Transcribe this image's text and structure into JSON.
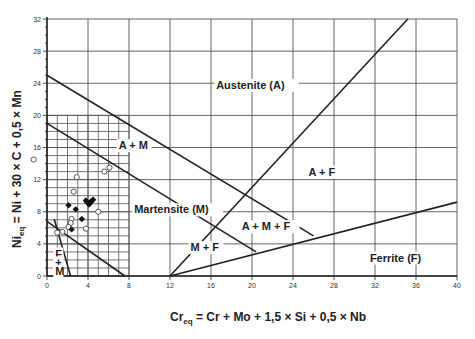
{
  "chart_data": {
    "type": "scatter",
    "title": "",
    "xlabel": "Cr_eq = Cr + Mo + 1,5 × Si + 0,5 × Nb",
    "xlabel_main": "Cr",
    "xlabel_sub": "eq",
    "xlabel_rest": " = Cr + Mo + 1,5 × Si + 0,5 × Nb",
    "ylabel": "Ni_eq = Ni + 30 × C + 0,5 × Mn",
    "ylabel_main": "Ni",
    "ylabel_sub": "eq",
    "ylabel_rest": " = Ni + 30 × C + 0,5 × Mn",
    "xlim": [
      0,
      40
    ],
    "ylim": [
      0,
      32
    ],
    "x_ticks": [
      "0",
      "4",
      "8",
      "12",
      "16",
      "20",
      "24",
      "28",
      "32",
      "36",
      "40"
    ],
    "y_ticks": [
      "0",
      "4",
      "8",
      "12",
      "16",
      "20",
      "24",
      "28",
      "32"
    ],
    "grid": true,
    "fine_grid_region": {
      "x": [
        0,
        8
      ],
      "y": [
        0,
        20
      ],
      "step": 1
    },
    "boundary_lines": [
      {
        "name": "A/A+M",
        "points": [
          [
            0,
            25
          ],
          [
            26,
            5
          ]
        ]
      },
      {
        "name": "A+M/M",
        "points": [
          [
            0,
            19
          ],
          [
            20.4,
            3
          ]
        ]
      },
      {
        "name": "A/A+F",
        "points": [
          [
            12,
            0
          ],
          [
            35.2,
            32
          ]
        ]
      },
      {
        "name": "M/M+F",
        "points": [
          [
            7.6,
            0
          ],
          [
            0,
            6.8
          ]
        ]
      },
      {
        "name": "M+F/F",
        "points": [
          [
            12,
            0
          ],
          [
            40,
            9.2
          ]
        ]
      },
      {
        "name": "F+M boundary",
        "points": [
          [
            0.7,
            7.1
          ],
          [
            2.3,
            0
          ]
        ]
      }
    ],
    "regions": [
      {
        "label": "Austenite (A)",
        "x": 16.5,
        "y": 23.3
      },
      {
        "label": "A + M",
        "x": 7,
        "y": 15.8
      },
      {
        "label": "A + F",
        "x": 25.5,
        "y": 12.5
      },
      {
        "label": "Martensite (M)",
        "x": 8.5,
        "y": 7.8
      },
      {
        "label": "A + M + F",
        "x": 19,
        "y": 5.7
      },
      {
        "label": "M + F",
        "x": 14,
        "y": 3.1
      },
      {
        "label": "Ferrite (F)",
        "x": 31.5,
        "y": 1.8
      },
      {
        "label": "F",
        "x": 0.8,
        "y": 2.3
      },
      {
        "label": "+",
        "x": 0.8,
        "y": 1.2
      },
      {
        "label": "M",
        "x": 0.8,
        "y": 0.1
      }
    ],
    "series": [
      {
        "name": "open circles",
        "marker": "open-circle",
        "points": [
          [
            -1.3,
            14.5
          ],
          [
            5.6,
            13
          ],
          [
            6.1,
            13.5
          ],
          [
            2.9,
            12.3
          ],
          [
            2.6,
            10.5
          ],
          [
            3.8,
            5.9
          ],
          [
            2.4,
            7.1
          ],
          [
            2.3,
            6.6
          ],
          [
            2.1,
            6.1
          ],
          [
            1.5,
            5.5
          ],
          [
            1,
            5.4
          ],
          [
            5,
            8
          ]
        ]
      },
      {
        "name": "filled diamonds",
        "marker": "filled-diamond",
        "points": [
          [
            2.1,
            8.8
          ],
          [
            2.8,
            8.3
          ],
          [
            3.4,
            7.1
          ],
          [
            2.4,
            5.8
          ],
          [
            3.9,
            9.2
          ],
          [
            4.1,
            8.9
          ],
          [
            4.3,
            9.3
          ],
          [
            4.5,
            9.5
          ],
          [
            3.8,
            9.4
          ],
          [
            4.2,
            9.1
          ]
        ]
      }
    ]
  }
}
